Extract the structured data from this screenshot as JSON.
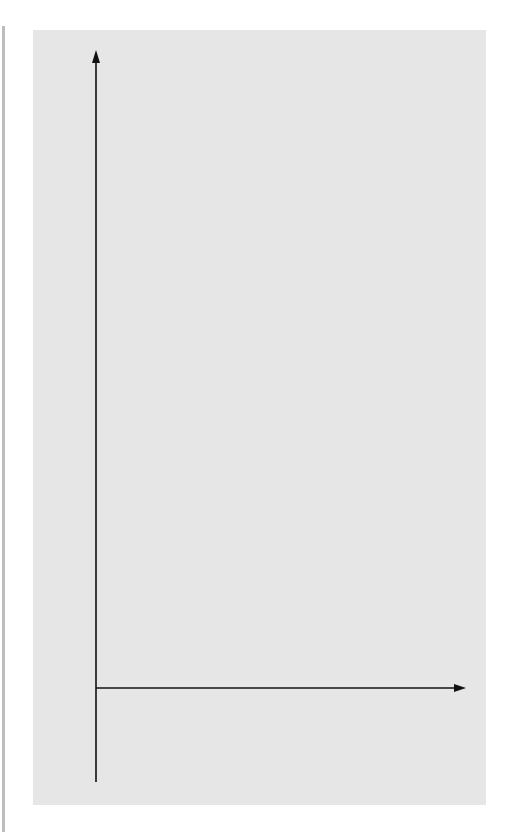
{
  "chart_data": {
    "type": "line",
    "title": "",
    "function": "f(x) = x^10 - 1",
    "xlabel": "x",
    "ylabel": "f(x)",
    "x_tick_positions": [
      0.2,
      0.4,
      0.6,
      0.8,
      1.0,
      1.2
    ],
    "x_tick_labels": [
      {
        "value": 1.0,
        "label": "1.0"
      }
    ],
    "y_tick_positions": [
      1,
      2,
      3,
      4,
      5,
      6,
      7,
      8,
      9,
      10,
      11,
      12,
      13
    ],
    "y_tick_labels": [
      {
        "value": 0,
        "label": "0"
      },
      {
        "value": 5,
        "label": "5"
      },
      {
        "value": 10,
        "label": "10"
      }
    ],
    "xlim": [
      0,
      1.55
    ],
    "ylim": [
      -2,
      13.5
    ],
    "grid": false,
    "legend": null,
    "series": [
      {
        "name": "f(x)",
        "style": "thick black curve",
        "x_range": [
          0,
          1.335
        ]
      },
      {
        "name": "secant lines (false position)",
        "style": "gray thick lines",
        "from_points": [
          [
            0,
            -1
          ],
          [
            0.1,
            -1
          ],
          [
            0.19,
            -1
          ],
          [
            0.275,
            -1
          ]
        ],
        "to_point": [
          1.3,
          12.79
        ]
      },
      {
        "name": "root estimates",
        "style": "dashed vertical",
        "x": [
          0.1,
          0.19,
          0.275
        ],
        "y_span": [
          -1,
          0
        ]
      }
    ],
    "points": [
      {
        "name": "lower bound",
        "x": 0,
        "y": -1
      },
      {
        "name": "upper bound",
        "x": 1.3,
        "y": 12.79
      },
      {
        "name": "true root",
        "x": 1.0,
        "y": 0
      }
    ],
    "colors": {
      "curve": "#000000",
      "secant": "#7a7a7a",
      "panel": "#e6e6e6"
    }
  }
}
